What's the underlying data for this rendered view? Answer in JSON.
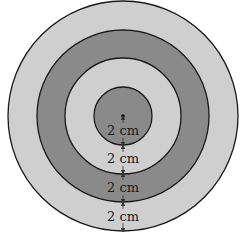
{
  "diagram": {
    "type": "concentric-circles",
    "rings": [
      {
        "name": "outer-ring",
        "radius_px": 115,
        "fill": "#cfcfcf"
      },
      {
        "name": "third-ring",
        "radius_px": 86,
        "fill": "#8a8a8a"
      },
      {
        "name": "second-ring",
        "radius_px": 58,
        "fill": "#cfcfcf"
      },
      {
        "name": "inner-circle",
        "radius_px": 29,
        "fill": "#8a8a8a"
      }
    ],
    "labels": [
      "2 cm",
      "2 cm",
      "2 cm",
      "2 cm"
    ],
    "stroke_color": "#1a1a1a"
  }
}
